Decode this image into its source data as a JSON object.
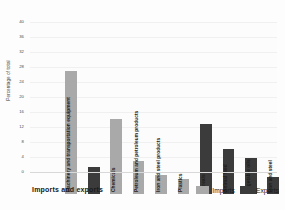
{
  "chart_data": {
    "type": "bar",
    "title": "Imports and exports",
    "xlabel": "",
    "ylabel": "Percentage of total",
    "ylim": [
      0,
      40
    ],
    "ytick_step": 4,
    "yticks": [
      "40",
      "36",
      "32",
      "28",
      "24",
      "20",
      "16",
      "12",
      "8",
      "4",
      "0"
    ],
    "grid": true,
    "legend_position": "bottom-right",
    "categories": [
      "Machinery and transportation equipment",
      "Chemicals",
      "Petroleum and petroleum products",
      "Iron and steel products",
      "Plastics",
      "Cereals",
      "Animal feed",
      "Vegetable oils",
      "Iron and steel",
      "Meat"
    ],
    "bars": [
      {
        "label": "Machinery and transportation equipment",
        "value": 32.8,
        "series": "Imports"
      },
      {
        "label": "",
        "value": 7.2,
        "series": "Exports"
      },
      {
        "label": "Chemicals",
        "value": 19.9,
        "series": "Imports"
      },
      {
        "label": "Petroleum and petroleum products",
        "value": 8.9,
        "series": "Imports"
      },
      {
        "label": "Iron and steel products",
        "value": 5.2,
        "series": "Imports"
      },
      {
        "label": "Plastics",
        "value": 4.1,
        "series": "Imports"
      },
      {
        "label": "Cereals",
        "value": 18.6,
        "series": "Exports"
      },
      {
        "label": "Animal feed",
        "value": 11.9,
        "series": "Exports"
      },
      {
        "label": "Vegetable oils",
        "value": 9.7,
        "series": "Exports"
      },
      {
        "label": "Iron and steel",
        "value": 4.6,
        "series": "Exports"
      },
      {
        "label": "Meat",
        "value": 4.0,
        "series": "Exports"
      }
    ],
    "series": [
      {
        "name": "Imports",
        "color": "#a9a9a9"
      },
      {
        "name": "Exports",
        "color": "#3b3b3b"
      }
    ]
  },
  "legend": {
    "imports_label": "Imports",
    "exports_label": "Exports"
  },
  "colors": {
    "imports": "#a9a9a9",
    "exports": "#3b3b3b",
    "background": "#fdfdfd",
    "axis_text": "#4a4a4a"
  }
}
